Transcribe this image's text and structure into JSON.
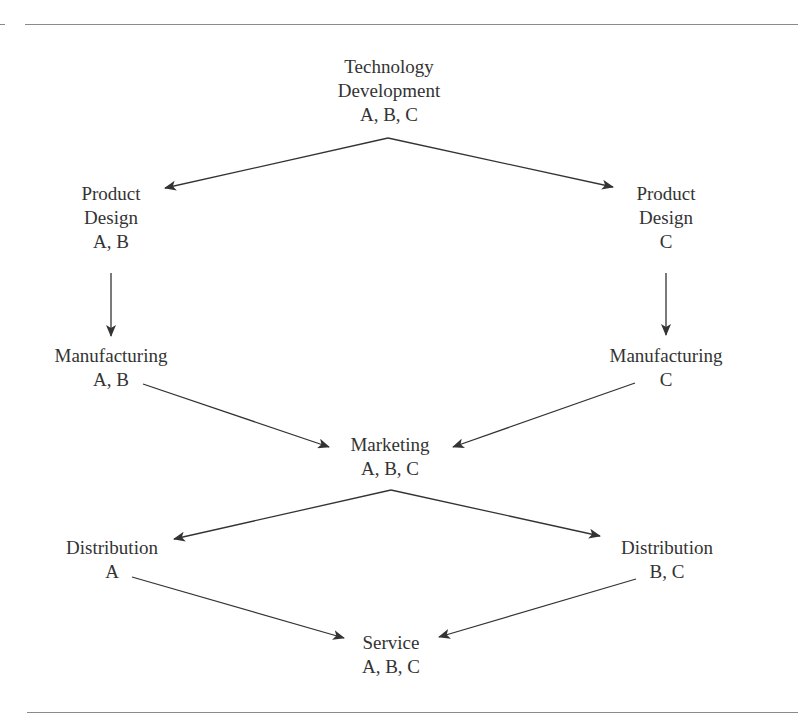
{
  "diagram": {
    "type": "flow-diagram",
    "colors": {
      "text": "#333333",
      "line": "#333333",
      "rule": "#8a8a8a",
      "background": "#ffffff"
    },
    "nodes": {
      "technology_development": {
        "line1": "Technology",
        "line2": "Development",
        "products": "A, B, C"
      },
      "product_design_ab": {
        "line1": "Product",
        "line2": "Design",
        "products": "A, B"
      },
      "product_design_c": {
        "line1": "Product",
        "line2": "Design",
        "products": "C"
      },
      "manufacturing_ab": {
        "line1": "Manufacturing",
        "products": "A, B"
      },
      "manufacturing_c": {
        "line1": "Manufacturing",
        "products": "C"
      },
      "marketing": {
        "line1": "Marketing",
        "products": "A, B, C"
      },
      "distribution_a": {
        "line1": "Distribution",
        "products": "A"
      },
      "distribution_bc": {
        "line1": "Distribution",
        "products": "B, C"
      },
      "service": {
        "line1": "Service",
        "products": "A, B, C"
      }
    },
    "edges": [
      {
        "from": "technology_development",
        "to": "product_design_ab"
      },
      {
        "from": "technology_development",
        "to": "product_design_c"
      },
      {
        "from": "product_design_ab",
        "to": "manufacturing_ab"
      },
      {
        "from": "product_design_c",
        "to": "manufacturing_c"
      },
      {
        "from": "manufacturing_ab",
        "to": "marketing"
      },
      {
        "from": "manufacturing_c",
        "to": "marketing"
      },
      {
        "from": "marketing",
        "to": "distribution_a"
      },
      {
        "from": "marketing",
        "to": "distribution_bc"
      },
      {
        "from": "distribution_a",
        "to": "service"
      },
      {
        "from": "distribution_bc",
        "to": "service"
      }
    ]
  }
}
